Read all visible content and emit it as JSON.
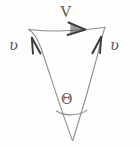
{
  "figure": {
    "kind": "hand-drawn-vector-triangle",
    "background_color": "#fdfdfd",
    "stroke_color": "#8a8a8a",
    "ink_color": "#555555",
    "width": 140,
    "height": 148,
    "labels": {
      "resultant": "V",
      "left_vector": "ʋ",
      "right_vector": "ʋ",
      "angle": "Θ"
    },
    "geometry": {
      "apex": {
        "x": 72,
        "y": 140
      },
      "top_left": {
        "x": 28,
        "y": 29
      },
      "top_right": {
        "x": 105,
        "y": 27
      },
      "arc": {
        "x_start": 56,
        "x_end": 87,
        "y": 113
      }
    },
    "arrows": {
      "resultant_direction": "right",
      "left_leg_direction": "up",
      "right_leg_direction": "up"
    }
  }
}
